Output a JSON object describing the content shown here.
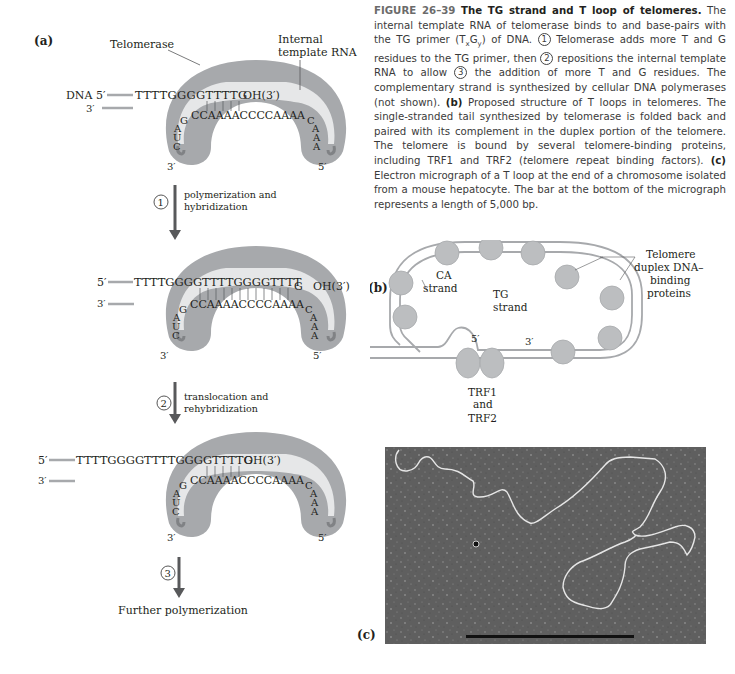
{
  "figure": {
    "number": "FIGURE 26–39",
    "title": "The TG strand and T loop of telomeres.",
    "caption_parts": {
      "p1": "The internal template RNA of telomerase binds to and base-pairs with the TG primer (T",
      "sub_x": "x",
      "mid": "G",
      "sub_y": "y",
      "p2": ") of DNA.",
      "step1_num": "1",
      "p3": "Telomerase adds more T and G residues to the TG primer, then",
      "step2_num": "2",
      "p4": "repositions the internal template RNA to allow",
      "step3_num": "3",
      "p5": "the addition of more T and G residues. The complementary strand is synthesized by cellular DNA polymerases (not shown).",
      "b_label": "(b)",
      "p6": "Proposed structure of T loops in telomeres. The single-stranded tail synthesized by telomerase is folded back and paired with its complement in the duplex portion of the telomere. The telomere is bound by several telomere-binding proteins, including TRF1 and TRF2 (",
      "italic_t": "t",
      "p7": "elomere ",
      "italic_r": "r",
      "p8": "epeat binding ",
      "italic_f": "f",
      "p9": "actors).",
      "c_label": "(c)",
      "p10": "Electron micrograph of a T loop at the end of a chromosome isolated from a mouse hepatocyte. The bar at the bottom of the micrograph represents a length of 5,000 bp."
    }
  },
  "panel_a": {
    "label": "(a)",
    "enzyme_label": "Telomerase",
    "template_label_line1": "Internal",
    "template_label_line2": "template RNA",
    "stage1": {
      "dna_prefix": "DNA 5′",
      "dna_seq": "TTTTGGGGTTTTG",
      "oh": "OH(3′)",
      "bottom_3prime": "3′",
      "rna_left": [
        "C",
        "U",
        "A",
        "G"
      ],
      "rna_top": "CCAAAACCCCAAAA",
      "rna_right": [
        "C",
        "A",
        "A",
        "A"
      ],
      "end_left": "3′",
      "end_right": "5′"
    },
    "step1": {
      "num": "1",
      "line1": "polymerization and",
      "line2": "hybridization"
    },
    "stage2": {
      "dna_prefix": "5′",
      "dna_seq": "TTTTGGGGTTTTGGGGTTTT",
      "dna_tail": "G",
      "oh": "OH(3′)",
      "bottom_3prime": "3′",
      "rna_top": "CCAAAACCCCAAAA",
      "end_left": "3′",
      "end_right": "5′"
    },
    "step2": {
      "num": "2",
      "line1": "translocation and",
      "line2": "rehybridization"
    },
    "stage3": {
      "dna_prefix": "5′",
      "dna_seq": "TTTTGGGGTTTTGGGGTTTTG",
      "oh": "OH(3′)",
      "bottom_3prime": "3′",
      "rna_top": "CCAAAACCCCAAAA",
      "end_left": "3′",
      "end_right": "5′"
    },
    "step3": {
      "num": "3",
      "label": "Further polymerization"
    }
  },
  "panel_b": {
    "label": "(b)",
    "ca_line1": "CA",
    "ca_line2": "strand",
    "tg_line1": "TG",
    "tg_line2": "strand",
    "five_prime": "5′",
    "three_prime": "3′",
    "proteins_line1": "Telomere",
    "proteins_line2": "duplex DNA–",
    "proteins_line3": "binding",
    "proteins_line4": "proteins",
    "trf_line1": "TRF1",
    "trf_line2": "and",
    "trf_line3": "TRF2"
  },
  "panel_c": {
    "label": "(c)",
    "scale_bar": "5,000 bp"
  },
  "colors": {
    "enzyme": "#a7a9ac",
    "template_band": "#e6e7e8",
    "arrow": "#58595b",
    "dna_strand": "#a7a9ac",
    "protein": "#bcbec0",
    "micrograph_bg": "#5f5f5f"
  }
}
